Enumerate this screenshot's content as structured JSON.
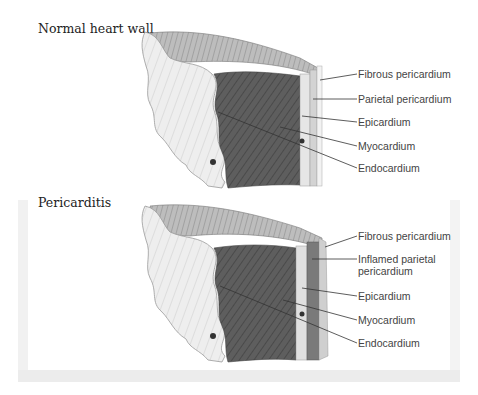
{
  "panels": [
    {
      "title": "Normal heart wall",
      "labels": [
        "Fibrous pericardium",
        "Parietal pericardium",
        "Epicardium",
        "Myocardium",
        "Endocardium"
      ]
    },
    {
      "title": "Pericarditis",
      "labels": [
        "Fibrous pericardium",
        "Inflamed parietal pericardium",
        "Epicardium",
        "Myocardium",
        "Endocardium"
      ],
      "label_lines": {
        "inflamed_line1": "Inflamed parietal",
        "inflamed_line2": "pericardium"
      }
    }
  ],
  "colors": {
    "myocardium": "#5a5a5a",
    "outer_tissue": "#e4e4e4",
    "inflamed_layer": "#7a7a7a",
    "leader_line": "#333333",
    "frame_shadow": "#ececec"
  }
}
